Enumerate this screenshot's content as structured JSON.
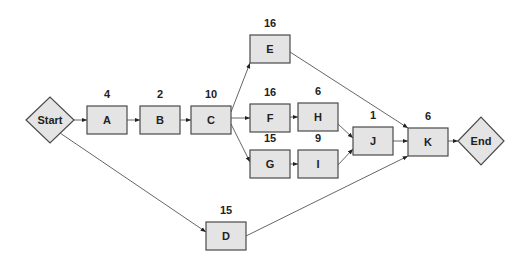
{
  "diagram": {
    "type": "activity-network",
    "nodes": [
      {
        "id": "start",
        "label": "Start",
        "shape": "diamond",
        "cx": 50,
        "cy": 120,
        "hw": 24,
        "hh": 23
      },
      {
        "id": "A",
        "label": "A",
        "duration": "4",
        "shape": "box",
        "x": 87,
        "y": 106,
        "w": 40,
        "h": 28
      },
      {
        "id": "B",
        "label": "B",
        "duration": "2",
        "shape": "box",
        "x": 140,
        "y": 106,
        "w": 40,
        "h": 28
      },
      {
        "id": "C",
        "label": "C",
        "duration": "10",
        "shape": "box",
        "x": 191,
        "y": 106,
        "w": 40,
        "h": 28
      },
      {
        "id": "E",
        "label": "E",
        "duration": "16",
        "shape": "box",
        "x": 250,
        "y": 35,
        "w": 40,
        "h": 28
      },
      {
        "id": "F",
        "label": "F",
        "duration": "16",
        "shape": "box",
        "x": 250,
        "y": 104,
        "w": 40,
        "h": 28
      },
      {
        "id": "H",
        "label": "H",
        "duration": "6",
        "shape": "box",
        "x": 298,
        "y": 103,
        "w": 40,
        "h": 28
      },
      {
        "id": "G",
        "label": "G",
        "duration": "15",
        "shape": "box",
        "x": 250,
        "y": 150,
        "w": 40,
        "h": 28
      },
      {
        "id": "I",
        "label": "I",
        "duration": "9",
        "shape": "box",
        "x": 298,
        "y": 150,
        "w": 40,
        "h": 28
      },
      {
        "id": "J",
        "label": "J",
        "duration": "1",
        "shape": "box",
        "x": 353,
        "y": 127,
        "w": 40,
        "h": 28
      },
      {
        "id": "K",
        "label": "K",
        "duration": "6",
        "shape": "box",
        "x": 408,
        "y": 128,
        "w": 40,
        "h": 28
      },
      {
        "id": "D",
        "label": "D",
        "duration": "15",
        "shape": "box",
        "x": 206,
        "y": 222,
        "w": 40,
        "h": 28
      },
      {
        "id": "end",
        "label": "End",
        "shape": "diamond",
        "cx": 481,
        "cy": 141,
        "hw": 23,
        "hh": 24
      }
    ],
    "edges": [
      {
        "from": "start",
        "to": "A",
        "x1": 74,
        "y1": 120,
        "x2": 87,
        "y2": 120
      },
      {
        "from": "A",
        "to": "B",
        "x1": 127,
        "y1": 120,
        "x2": 140,
        "y2": 120
      },
      {
        "from": "B",
        "to": "C",
        "x1": 180,
        "y1": 120,
        "x2": 191,
        "y2": 120
      },
      {
        "from": "C",
        "to": "E",
        "x1": 231,
        "y1": 112,
        "x2": 250,
        "y2": 63
      },
      {
        "from": "C",
        "to": "F",
        "x1": 231,
        "y1": 118,
        "x2": 250,
        "y2": 118
      },
      {
        "from": "C",
        "to": "G",
        "x1": 231,
        "y1": 124,
        "x2": 250,
        "y2": 162
      },
      {
        "from": "F",
        "to": "H",
        "x1": 290,
        "y1": 117,
        "x2": 298,
        "y2": 117
      },
      {
        "from": "G",
        "to": "I",
        "x1": 290,
        "y1": 164,
        "x2": 298,
        "y2": 164
      },
      {
        "from": "H",
        "to": "J",
        "x1": 338,
        "y1": 124,
        "x2": 353,
        "y2": 138
      },
      {
        "from": "I",
        "to": "J",
        "x1": 338,
        "y1": 165,
        "x2": 353,
        "y2": 149
      },
      {
        "from": "E",
        "to": "K",
        "x1": 290,
        "y1": 52,
        "x2": 408,
        "y2": 128
      },
      {
        "from": "J",
        "to": "K",
        "x1": 393,
        "y1": 141,
        "x2": 408,
        "y2": 141
      },
      {
        "from": "D",
        "to": "K",
        "x1": 246,
        "y1": 236,
        "x2": 408,
        "y2": 156
      },
      {
        "from": "start",
        "to": "D",
        "x1": 60,
        "y1": 133,
        "x2": 206,
        "y2": 232
      },
      {
        "from": "K",
        "to": "end",
        "x1": 448,
        "y1": 141,
        "x2": 458,
        "y2": 141
      }
    ]
  }
}
